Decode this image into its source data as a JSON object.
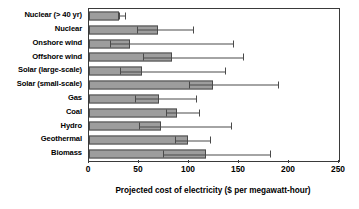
{
  "chart_data": {
    "type": "bar",
    "orientation": "horizontal",
    "title": "",
    "xlabel": "Projected cost of electricity ($ per megawatt-hour)",
    "ylabel": "",
    "xlim": [
      0,
      250
    ],
    "xticks": [
      0,
      50,
      100,
      150,
      200,
      250
    ],
    "xticklabels": [
      "0",
      "50",
      "100",
      "150",
      "200",
      "250"
    ],
    "grid": false,
    "legend": false,
    "error_bars": "asymmetric range (low cap to high cap)",
    "bar_color": "#9d9d9d",
    "bar_edge_color": "#4a4a4a",
    "axis_color": "#3a3a3a",
    "categories": [
      "Nuclear (> 40 yr)",
      "Nuclear",
      "Onshore wind",
      "Offshore wind",
      "Solar (large-scale)",
      "Solar (small-scale)",
      "Gas",
      "Coal",
      "Hydro",
      "Geothermal",
      "Biomass"
    ],
    "values": [
      30,
      69,
      41,
      83,
      53,
      124,
      70,
      88,
      72,
      99,
      117
    ],
    "err_low": [
      30,
      48,
      21,
      54,
      31,
      100,
      46,
      77,
      50,
      86,
      74
    ],
    "err_high": [
      37,
      105,
      145,
      155,
      137,
      190,
      108,
      111,
      143,
      122,
      182
    ]
  },
  "axis_title": "Projected cost of electricity ($ per megawatt-hour)"
}
